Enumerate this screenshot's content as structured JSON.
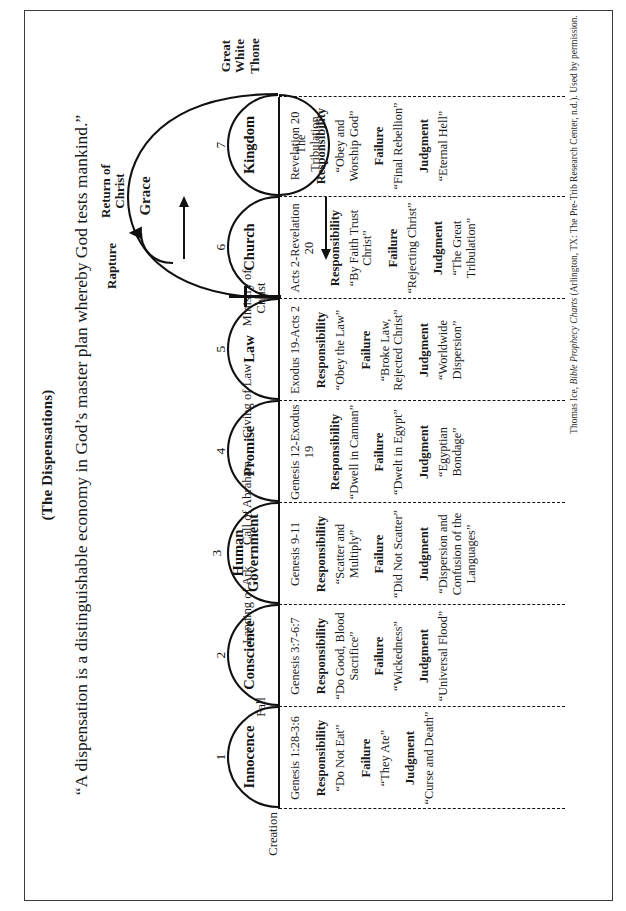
{
  "page": {
    "title": "(The Dispensations)",
    "subtitle": "“A dispensation is a distinguishable economy in God’s master plan whereby God tests mankind.”",
    "credit_author": "Thomas Ice, ",
    "credit_work": "Bible Prophecy Charts",
    "credit_pub": " (Arlington, TX: The Pre-Trib Research Center, n.d.). Used by permission."
  },
  "labels": {
    "responsibility": "Responsibility",
    "failure": "Failure",
    "judgment": "Judgment"
  },
  "dispensations": [
    {
      "number": "1",
      "name": "Innocence",
      "reference": "Genesis 1:28-3:6",
      "responsibility": "“Do Not Eat”",
      "failure": "“They Ate”",
      "judgment": "“Curse and Death”"
    },
    {
      "number": "2",
      "name": "Conscience",
      "reference": "Genesis 3:7-6:7",
      "responsibility": "“Do Good, Blood Sacrifice”",
      "failure": "“Wickedness”",
      "judgment": "“Universal Flood”"
    },
    {
      "number": "3",
      "name": "Human Government",
      "reference": "Genesis 9-11",
      "responsibility": "“Scatter and Multiply”",
      "failure": "“Did Not Scatter”",
      "judgment": "“Dispersion and Confusion of the Languages”"
    },
    {
      "number": "4",
      "name": "Promise",
      "reference": "Genesis 12-Exodus 19",
      "responsibility": "“Dwell in Cannan”",
      "failure": "“Dwelt in Egypt”",
      "judgment": "“Egyptian Bondage”"
    },
    {
      "number": "5",
      "name": "Law",
      "reference": "Exodus 19-Acts 2",
      "responsibility": "“Obey the Law”",
      "failure": "“Broke Law, Rejected Christ”",
      "judgment": "“Worldwide Dispersion”"
    },
    {
      "number": "6",
      "name": "Church",
      "reference": "Acts 2-Revelation 20",
      "responsibility": "“By Faith Trust Christ”",
      "failure": "“Rejecting Christ”",
      "judgment": "“The Great Tribulation”"
    },
    {
      "number": "7",
      "name": "Kingdom",
      "reference": "Revelation 20",
      "responsibility": "“Obey and Worship God”",
      "failure": "“Final Rebellion”",
      "judgment": "“Eternal Hell”"
    }
  ],
  "events": {
    "creation": "Creation",
    "fall": "Fall",
    "landing_of_ark": "Landing of Ark",
    "call_of_abraham": "Call of Abraham",
    "giving_of_law": "Giving of Law",
    "ministry_of_christ": "Ministry of Christ",
    "rapture": "Rapture",
    "return_of_christ": "Return of Christ",
    "great_white_throne": "Great White Thone"
  },
  "overlays": {
    "grace": "Grace",
    "tribulation": "The Tribulation"
  }
}
